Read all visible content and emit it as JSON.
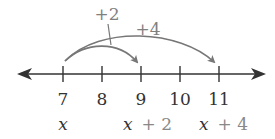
{
  "number_line": {
    "ticks": [
      {
        "value": "7",
        "x": 63
      },
      {
        "value": "8",
        "x": 102
      },
      {
        "value": "9",
        "x": 141
      },
      {
        "value": "10",
        "x": 180
      },
      {
        "value": "11",
        "x": 219
      }
    ],
    "variable_labels": {
      "x": "x",
      "x_plus_2_var": "x",
      "x_plus_2_op": "+ 2",
      "x_plus_4_var": "x",
      "x_plus_4_op": "+ 4"
    },
    "jumps": [
      {
        "label": "+2",
        "from": "7",
        "to": "9"
      },
      {
        "label": "+4",
        "from": "7",
        "to": "11"
      }
    ],
    "colors": {
      "axis": "#333333",
      "arc": "#777777",
      "jump_label": "#808080"
    }
  }
}
